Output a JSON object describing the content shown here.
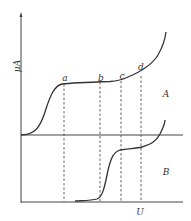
{
  "diagram": {
    "y_axis_label": "μA",
    "x_axis_label": "U",
    "curve_labels": {
      "upper": "A",
      "lower": "B"
    },
    "points": [
      {
        "label": "a",
        "x": 64
      },
      {
        "label": "b",
        "x": 100
      },
      {
        "label": "c",
        "x": 121
      },
      {
        "label": "d",
        "x": 141
      }
    ]
  }
}
